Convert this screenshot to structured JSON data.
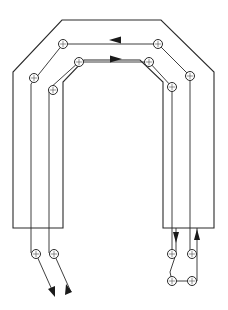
{
  "diagram": {
    "type": "technical-line-drawing",
    "colors": {
      "line": "#2a2a2a",
      "background": "#ffffff"
    },
    "outer_outline": [
      [
        13,
        228
      ],
      [
        13,
        72
      ],
      [
        62,
        20
      ],
      [
        161,
        20
      ],
      [
        214,
        72
      ],
      [
        214,
        228
      ],
      [
        163,
        228
      ],
      [
        163,
        82
      ],
      [
        140,
        60
      ],
      [
        84,
        60
      ],
      [
        63,
        82
      ],
      [
        63,
        228
      ],
      [
        13,
        228
      ]
    ],
    "paths": [
      {
        "name": "outer-path",
        "direction": "right-to-left along top",
        "points": [
          [
            31,
            265
          ],
          [
            31,
            84
          ],
          [
            63,
            44
          ],
          [
            158,
            44
          ],
          [
            190,
            76
          ],
          [
            190,
            228
          ]
        ]
      },
      {
        "name": "inner-path",
        "direction": "left-to-right along top",
        "points": [
          [
            49,
            265
          ],
          [
            49,
            89
          ],
          [
            79,
            62
          ],
          [
            149,
            62
          ],
          [
            172,
            87
          ],
          [
            172,
            228
          ]
        ]
      }
    ],
    "nodes": [
      {
        "x": 63,
        "y": 44
      },
      {
        "x": 158,
        "y": 44
      },
      {
        "x": 34,
        "y": 78
      },
      {
        "x": 190,
        "y": 76
      },
      {
        "x": 79,
        "y": 62
      },
      {
        "x": 149,
        "y": 62
      },
      {
        "x": 53,
        "y": 90
      },
      {
        "x": 172,
        "y": 87
      },
      {
        "x": 36,
        "y": 254
      },
      {
        "x": 54,
        "y": 254
      },
      {
        "x": 172,
        "y": 254
      },
      {
        "x": 192,
        "y": 254
      },
      {
        "x": 172,
        "y": 281
      },
      {
        "x": 192,
        "y": 281
      }
    ],
    "arrows": [
      {
        "x": 115,
        "y": 40,
        "dir": "left"
      },
      {
        "x": 116,
        "y": 59,
        "dir": "right"
      },
      {
        "x": 177,
        "y": 236,
        "dir": "down"
      },
      {
        "x": 197,
        "y": 236,
        "dir": "up"
      },
      {
        "x": 53,
        "y": 293,
        "dir": "down-right"
      },
      {
        "x": 70,
        "y": 290,
        "dir": "up-left"
      }
    ]
  }
}
